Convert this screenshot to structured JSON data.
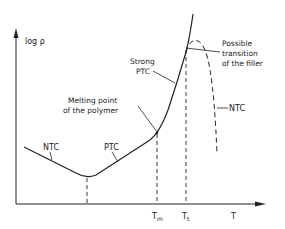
{
  "diagram": {
    "type": "resistivity-vs-temperature",
    "y_axis_label": "log ρ",
    "x_axis_label": "T",
    "x_ticks": [
      {
        "id": "Tm",
        "label": "T",
        "subscript": "m"
      },
      {
        "id": "Tt",
        "label": "T",
        "subscript": "t"
      }
    ],
    "annotations": {
      "ntc_left": "NTC",
      "ptc": "PTC",
      "melting_line1": "Melting point",
      "melting_line2": "of the polymer",
      "strong_line1": "Strong",
      "strong_line2": "PTC",
      "possible_line1": "Possible",
      "possible_line2": "transition",
      "possible_line3": "of the filler",
      "ntc_right": "NTC"
    },
    "colors": {
      "line": "#222222",
      "background": "#ffffff"
    }
  }
}
